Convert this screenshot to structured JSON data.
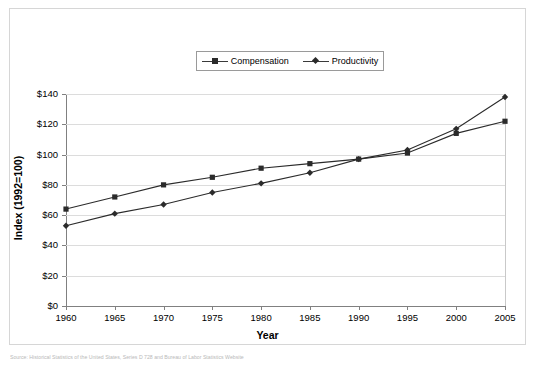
{
  "figure": {
    "caption": "Source: Historical Statistics of the United States, Series D 728 and Bureau of Labor Statistics Website"
  },
  "legend": {
    "position": "top-center",
    "entries": [
      {
        "label": "Compensation",
        "marker": "square",
        "color": "#2b2b2b"
      },
      {
        "label": "Productivity",
        "marker": "diamond",
        "color": "#2b2b2b"
      }
    ]
  },
  "axes": {
    "x_title": "Year",
    "y_title": "Index (1992=100)",
    "x_tick_labels": [
      "1960",
      "1965",
      "1970",
      "1975",
      "1980",
      "1985",
      "1990",
      "1995",
      "2000",
      "2005"
    ],
    "y_tick_labels": [
      "$0",
      "$20",
      "$40",
      "$60",
      "$80",
      "$100",
      "$120",
      "$140"
    ]
  },
  "chart_data": {
    "type": "line",
    "title": "",
    "subtitle": "",
    "xlabel": "Year",
    "ylabel": "Index (1992=100)",
    "x": [
      1960,
      1965,
      1970,
      1975,
      1980,
      1985,
      1990,
      1995,
      2000,
      2005
    ],
    "categories": [
      "1960",
      "1965",
      "1970",
      "1975",
      "1980",
      "1985",
      "1990",
      "1995",
      "2000",
      "2005"
    ],
    "series": [
      {
        "name": "Compensation",
        "marker": "square",
        "color": "#2b2b2b",
        "values": [
          64,
          72,
          80,
          85,
          91,
          94,
          97,
          101,
          114,
          122
        ]
      },
      {
        "name": "Productivity",
        "marker": "diamond",
        "color": "#2b2b2b",
        "values": [
          53,
          61,
          67,
          75,
          81,
          88,
          97,
          103,
          117,
          138
        ]
      }
    ],
    "xlim": [
      1960,
      2005
    ],
    "ylim": [
      0,
      140
    ],
    "y_ticks": [
      0,
      20,
      40,
      60,
      80,
      100,
      120,
      140
    ],
    "y_tick_labels": [
      "$0",
      "$20",
      "$40",
      "$60",
      "$80",
      "$100",
      "$120",
      "$140"
    ],
    "x_ticks": [
      1960,
      1965,
      1970,
      1975,
      1980,
      1985,
      1990,
      1995,
      2000,
      2005
    ],
    "grid": "horizontal",
    "legend_position": "top-center",
    "annotations": []
  }
}
